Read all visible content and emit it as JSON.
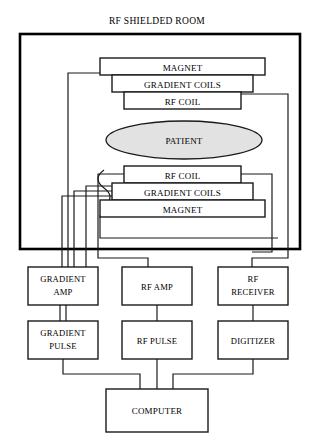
{
  "figure": {
    "title": "RF SHIELDED ROOM",
    "kind": "block-diagram",
    "colors": {
      "stroke": "#1a1a1a",
      "room_border": "#000000",
      "patient_fill": "#e2e2e2",
      "box_fill": "#ffffff",
      "background": "#ffffff"
    }
  },
  "room": {
    "label": "RF SHIELDED ROOM",
    "upper_stack": [
      {
        "id": "magnet-top",
        "label": "MAGNET"
      },
      {
        "id": "gradient-coils-top",
        "label": "GRADIENT COILS"
      },
      {
        "id": "rf-coil-top",
        "label": "RF COIL"
      }
    ],
    "patient": {
      "id": "patient",
      "label": "PATIENT"
    },
    "lower_stack": [
      {
        "id": "rf-coil-bottom",
        "label": "RF COIL"
      },
      {
        "id": "gradient-coils-bottom",
        "label": "GRADIENT COILS"
      },
      {
        "id": "magnet-bottom",
        "label": "MAGNET"
      }
    ]
  },
  "electronics": {
    "row_amplifiers": [
      {
        "id": "gradient-amp",
        "line1": "GRADIENT",
        "line2": "AMP"
      },
      {
        "id": "rf-amp",
        "line1": "RF AMP",
        "line2": ""
      },
      {
        "id": "rf-receiver",
        "line1": "RF",
        "line2": "RECEIVER"
      }
    ],
    "row_sources": [
      {
        "id": "gradient-pulse",
        "line1": "GRADIENT",
        "line2": "PULSE"
      },
      {
        "id": "rf-pulse",
        "line1": "RF PULSE",
        "line2": ""
      },
      {
        "id": "digitizer",
        "line1": "DIGITIZER",
        "line2": ""
      }
    ],
    "computer": {
      "id": "computer",
      "label": "COMPUTER"
    }
  }
}
